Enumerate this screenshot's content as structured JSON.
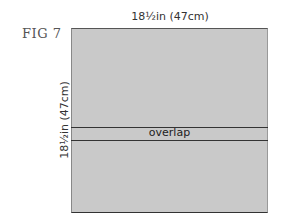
{
  "figure": {
    "label": "FIG 7",
    "width_dimension": "18½in (47cm)",
    "height_dimension": "18½in (47cm)",
    "overlap_label": "overlap",
    "colors": {
      "panel_fill": "#c9c9c9",
      "outline": "#333333",
      "background": "#ffffff"
    }
  }
}
